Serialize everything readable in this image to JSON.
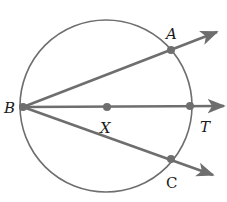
{
  "diagram": {
    "type": "geometry",
    "colors": {
      "stroke": "#6e6e6e",
      "text": "#1a1a1a",
      "background": "#ffffff"
    },
    "circle": {
      "cx": 106,
      "cy": 106,
      "r": 86
    },
    "points": [
      {
        "id": "B",
        "label": "B",
        "x": 23,
        "y": 107
      },
      {
        "id": "A",
        "label": "A",
        "x": 171,
        "y": 50
      },
      {
        "id": "X",
        "label": "X",
        "x": 107,
        "y": 107
      },
      {
        "id": "T",
        "label": "T",
        "x": 190,
        "y": 106
      },
      {
        "id": "C",
        "label": "C",
        "x": 171,
        "y": 159
      }
    ],
    "rays": [
      {
        "name": "ray-BA",
        "from": "B",
        "through": "A"
      },
      {
        "name": "ray-BT",
        "from": "B",
        "through": "T"
      },
      {
        "name": "ray-BC",
        "from": "B",
        "through": "C"
      }
    ],
    "labels": {
      "B": "B",
      "A": "A",
      "X": "X",
      "T": "T",
      "C": "C"
    }
  }
}
